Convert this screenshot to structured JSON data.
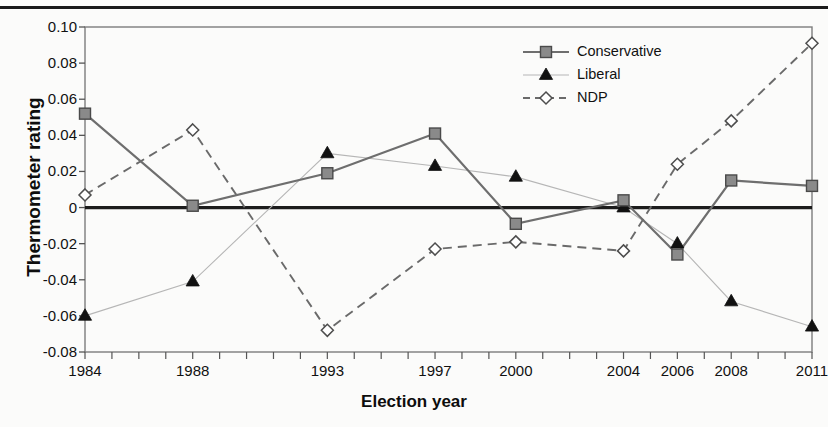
{
  "chart_data": {
    "type": "line",
    "title": "",
    "xlabel": "Election year",
    "ylabel": "Thermometer rating",
    "x": [
      1984,
      1988,
      1993,
      1997,
      2000,
      2004,
      2006,
      2008,
      2011
    ],
    "categories": [
      "1984",
      "1988",
      "1993",
      "1997",
      "2000",
      "2004",
      "2006",
      "2008",
      "2011"
    ],
    "xlim": [
      1984,
      2011
    ],
    "ylim": [
      -0.08,
      0.1
    ],
    "yticks": [
      -0.08,
      -0.06,
      -0.04,
      -0.02,
      0,
      0.02,
      0.04,
      0.06,
      0.08,
      0.1
    ],
    "ytick_labels": [
      "-0.08",
      "-0.06",
      "-0.04",
      "-0.02",
      "0",
      "0.02",
      "0.04",
      "0.06",
      "0.08",
      "0.10"
    ],
    "grid": false,
    "zero_line": true,
    "legend_position": "top-right",
    "x_minor_ticks_every": 1,
    "series": [
      {
        "name": "Conservative",
        "marker": "filled-square",
        "line_style": "solid",
        "color": "#6e6e6e",
        "marker_color": "#8a8a8a",
        "values": [
          0.052,
          0.001,
          0.019,
          0.041,
          -0.009,
          0.004,
          -0.026,
          0.015,
          0.012
        ]
      },
      {
        "name": "Liberal",
        "marker": "filled-triangle",
        "line_style": "solid-thin",
        "color": "#b6b6b6",
        "marker_color": "#111111",
        "values": [
          -0.06,
          -0.041,
          0.03,
          0.023,
          0.017,
          0.0,
          -0.02,
          -0.052,
          -0.066
        ]
      },
      {
        "name": "NDP",
        "marker": "open-diamond",
        "line_style": "dashed",
        "color": "#6a6a6a",
        "marker_color": "#ffffff",
        "values": [
          0.007,
          0.043,
          -0.068,
          -0.023,
          -0.019,
          -0.024,
          0.024,
          0.048,
          0.091
        ]
      }
    ]
  },
  "legend": {
    "items": [
      {
        "label": "Conservative"
      },
      {
        "label": "Liberal"
      },
      {
        "label": "NDP"
      }
    ]
  },
  "axis": {
    "y_title": "Thermometer rating",
    "x_title": "Election year"
  }
}
